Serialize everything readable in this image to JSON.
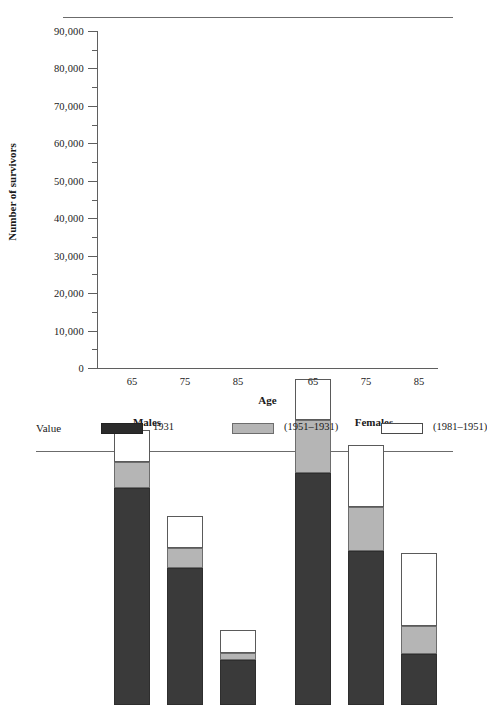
{
  "chart_data": {
    "type": "bar",
    "subtype": "stacked-bar-grouped",
    "title": "",
    "xlabel": "Age",
    "ylabel": "Number of survivors",
    "ylim": [
      0,
      90000
    ],
    "ytick_step": 10000,
    "yminor_step": 5000,
    "grid": false,
    "legend_position": "bottom",
    "legend_title": "Value",
    "categories": [
      "65",
      "75",
      "85",
      "65",
      "75",
      "85"
    ],
    "groups": [
      "Males",
      "Females"
    ],
    "group_categories": [
      "65",
      "75",
      "85"
    ],
    "series": [
      {
        "name": "1931",
        "color": "#3a3a3a",
        "values": [
          58000,
          36500,
          12000,
          62000,
          41000,
          13500
        ]
      },
      {
        "name": "(1951–1931)",
        "color": "#b5b5b5",
        "values": [
          7000,
          5500,
          2000,
          14000,
          12000,
          7500
        ]
      },
      {
        "name": "(1981–1951)",
        "color": "#ffffff",
        "values": [
          8500,
          8500,
          6000,
          11000,
          16500,
          19500
        ]
      }
    ],
    "cumulative_tops": [
      {
        "category": "Males 65",
        "s1931": 58000,
        "s1951_1931": 65000,
        "s1981_1951": 73500
      },
      {
        "category": "Males 75",
        "s1931": 36500,
        "s1951_1931": 42000,
        "s1981_1951": 50500
      },
      {
        "category": "Males 85",
        "s1931": 12000,
        "s1951_1931": 14000,
        "s1981_1951": 20000
      },
      {
        "category": "Females 65",
        "s1931": 62000,
        "s1951_1931": 76000,
        "s1981_1951": 87000
      },
      {
        "category": "Females 75",
        "s1931": 41000,
        "s1951_1931": 53000,
        "s1981_1951": 69500
      },
      {
        "category": "Females 85",
        "s1931": 13500,
        "s1951_1931": 21000,
        "s1981_1951": 40500
      }
    ],
    "ytick_labels": [
      "90,000",
      "80,000",
      "70,000",
      "60,000",
      "50,000",
      "40,000",
      "30,000",
      "20,000",
      "10,000",
      "0"
    ],
    "ytick_values": [
      90000,
      80000,
      70000,
      60000,
      50000,
      40000,
      30000,
      20000,
      10000,
      0
    ]
  },
  "axis": {
    "ylabel": "Number of survivors",
    "xlabel": "Age"
  },
  "groups": [
    {
      "label": "Males"
    },
    {
      "label": "Females"
    }
  ],
  "legend": {
    "title": "Value",
    "items": [
      {
        "label": "1931",
        "swatch": "dark-swatch"
      },
      {
        "label": "(1951–1931)",
        "swatch": "gray-swatch"
      },
      {
        "label": "(1981–1951)",
        "swatch": "white-swatch"
      }
    ]
  }
}
